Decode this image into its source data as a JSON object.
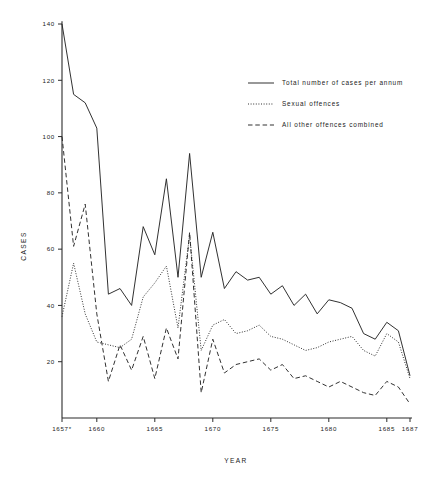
{
  "chart_data": {
    "type": "line",
    "title": "",
    "xlabel": "YEAR",
    "ylabel": "CASES",
    "xlim": [
      1657,
      1687
    ],
    "ylim": [
      0,
      140
    ],
    "grid": false,
    "legend_position": "top-right",
    "x_tick_labels": [
      "1657*",
      "1660",
      "1665",
      "1670",
      "1675",
      "1680",
      "1685",
      "1687"
    ],
    "x_tick_values": [
      1657,
      1660,
      1665,
      1670,
      1675,
      1680,
      1685,
      1687
    ],
    "y_tick_labels": [
      "20",
      "40",
      "60",
      "80",
      "100",
      "120",
      "140"
    ],
    "y_tick_values": [
      20,
      40,
      60,
      80,
      100,
      120,
      140
    ],
    "x": [
      1657,
      1658,
      1659,
      1660,
      1661,
      1662,
      1663,
      1664,
      1665,
      1666,
      1667,
      1668,
      1669,
      1670,
      1671,
      1672,
      1673,
      1674,
      1675,
      1676,
      1677,
      1678,
      1679,
      1680,
      1681,
      1682,
      1683,
      1684,
      1685,
      1686,
      1687
    ],
    "series": [
      {
        "name": "Total number of cases per annum",
        "style": "solid",
        "values": [
          140,
          115,
          112,
          103,
          44,
          46,
          40,
          68,
          58,
          85,
          50,
          94,
          50,
          66,
          46,
          52,
          49,
          50,
          44,
          47,
          40,
          44,
          37,
          42,
          41,
          39,
          30,
          28,
          34,
          31,
          15
        ]
      },
      {
        "name": "Sexual offences",
        "style": "dotted",
        "values": [
          36,
          55,
          37,
          27,
          26,
          25,
          28,
          43,
          48,
          54,
          32,
          65,
          24,
          33,
          35,
          30,
          31,
          33,
          29,
          28,
          26,
          24,
          25,
          27,
          28,
          29,
          24,
          22,
          30,
          27,
          14
        ]
      },
      {
        "name": "All other offences combined",
        "style": "dashed",
        "values": [
          100,
          61,
          76,
          37,
          13,
          26,
          17,
          29,
          14,
          32,
          21,
          66,
          9,
          28,
          16,
          19,
          20,
          21,
          17,
          19,
          14,
          15,
          13,
          11,
          13,
          11,
          9,
          8,
          13,
          11,
          5
        ]
      }
    ]
  },
  "legend": {
    "items": [
      {
        "label": "Total number of cases per annum",
        "style": "solid"
      },
      {
        "label": "Sexual offences",
        "style": "dotted"
      },
      {
        "label": "All other offences combined",
        "style": "dashed"
      }
    ]
  },
  "axes": {
    "y_title": "CASES",
    "x_title": "YEAR"
  }
}
